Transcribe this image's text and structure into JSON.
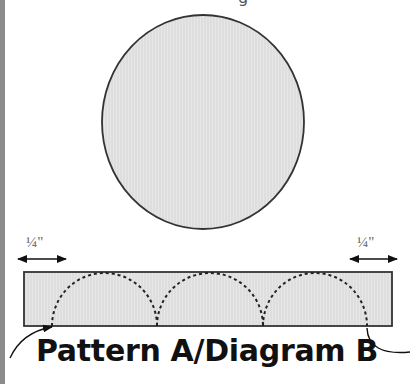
{
  "diagram": {
    "top_label_fragment": "g",
    "caption": "Pattern A/Diagram B",
    "left_measure_label": "¼\"",
    "right_measure_label": "¼\"",
    "circle": {
      "cx": 203,
      "cy": 122,
      "rx": 101,
      "ry": 107,
      "fill": "#e4e4e4",
      "stroke": "#333333"
    },
    "strip": {
      "x": 24,
      "y": 272,
      "width": 368,
      "height": 54,
      "fill": "#e4e4e4",
      "stroke": "#333333"
    },
    "scallops": [
      {
        "start_x": 52,
        "end_x": 157
      },
      {
        "start_x": 157,
        "end_x": 263
      },
      {
        "start_x": 263,
        "end_x": 367
      }
    ],
    "colors": {
      "line": "#222222",
      "fill": "#e4e4e4",
      "side_bar": "#8c8c8c",
      "text": "#111111"
    }
  }
}
